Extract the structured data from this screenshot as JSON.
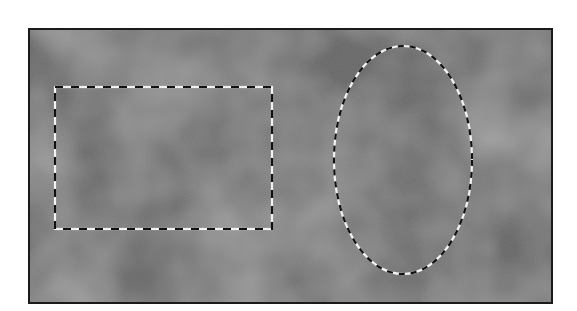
{
  "canvas": {
    "width": 577,
    "height": 311,
    "background_color": "#ffffff",
    "frame": {
      "x": 28,
      "y": 28,
      "width": 523,
      "height": 274,
      "border_color": "#1a1a1a",
      "texture_base": "#6e6e6e",
      "texture_light": "#8a8a8a",
      "texture_dark": "#5a5a5a"
    }
  },
  "selections": [
    {
      "type": "rectangle",
      "name": "rectangular-marquee-selection",
      "x": 53,
      "y": 85,
      "width": 217,
      "height": 142,
      "stroke_dark": "#111111",
      "stroke_light": "#f2f2f2",
      "dash": 8
    },
    {
      "type": "ellipse",
      "name": "elliptical-marquee-selection",
      "cx": 401,
      "cy": 158,
      "rx": 69,
      "ry": 114,
      "stroke_dark": "#111111",
      "stroke_light": "#f2f2f2",
      "dash": 6
    }
  ]
}
